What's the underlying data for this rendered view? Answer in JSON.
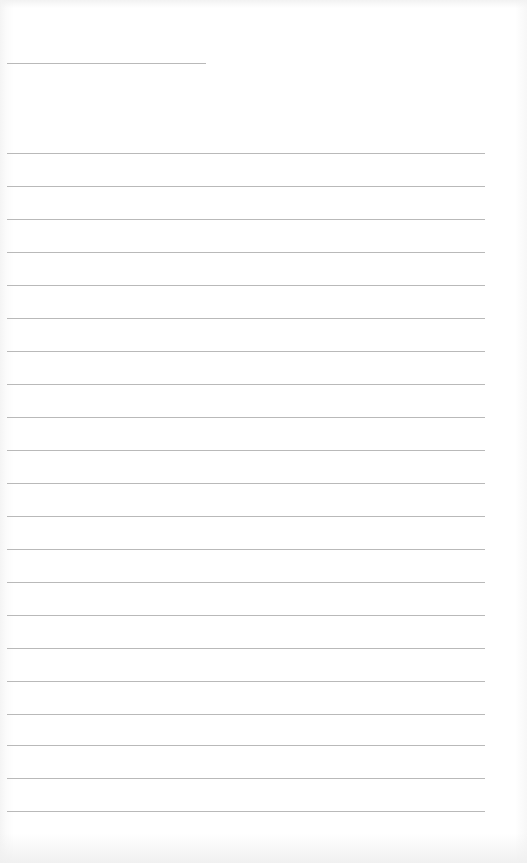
{
  "document": {
    "type": "blank lined page",
    "header_field": {
      "value": ""
    },
    "lines": [
      {
        "value": ""
      },
      {
        "value": ""
      },
      {
        "value": ""
      },
      {
        "value": ""
      },
      {
        "value": ""
      },
      {
        "value": ""
      },
      {
        "value": ""
      },
      {
        "value": ""
      },
      {
        "value": ""
      },
      {
        "value": ""
      },
      {
        "value": ""
      },
      {
        "value": ""
      },
      {
        "value": ""
      },
      {
        "value": ""
      },
      {
        "value": ""
      },
      {
        "value": ""
      },
      {
        "value": ""
      },
      {
        "value": ""
      },
      {
        "value": ""
      },
      {
        "value": ""
      },
      {
        "value": ""
      }
    ],
    "colors": {
      "paper": "#ffffff",
      "rule": "#b9b9b9"
    }
  }
}
